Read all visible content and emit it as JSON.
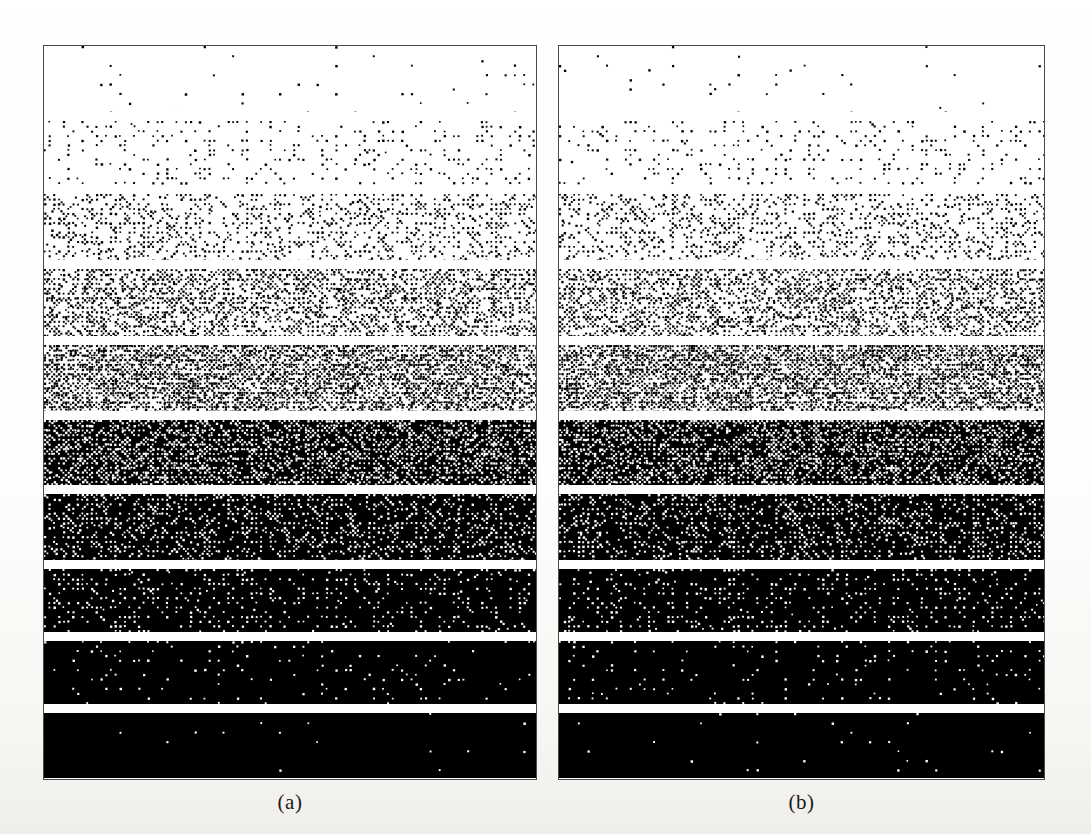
{
  "figure": {
    "type": "halftone-gradient-wedge-pair",
    "background_color": "#ffffff",
    "ink_color": "#000000",
    "border_color": "#4a4a4a",
    "panel_count": 2,
    "band_count_per_panel": 10
  },
  "captions": {
    "panel_a": "(a)",
    "panel_b": "(b)"
  },
  "panels": [
    {
      "id": "panel-a",
      "caption": "(a)",
      "x": 43,
      "y": 45,
      "width": 494,
      "height": 735,
      "bands": [
        {
          "index": 1,
          "gray_level": 0.06,
          "dot_size": 2.0,
          "label": "5%"
        },
        {
          "index": 2,
          "gray_level": 0.16,
          "dot_size": 2.0,
          "label": "15%"
        },
        {
          "index": 3,
          "gray_level": 0.29,
          "dot_size": 2.0,
          "label": "28%"
        },
        {
          "index": 4,
          "gray_level": 0.4,
          "dot_size": 2.0,
          "label": "40%"
        },
        {
          "index": 5,
          "gray_level": 0.5,
          "dot_size": 2.0,
          "label": "50%"
        },
        {
          "index": 6,
          "gray_level": 0.6,
          "dot_size": 2.0,
          "label": "60%"
        },
        {
          "index": 7,
          "gray_level": 0.7,
          "dot_size": 2.0,
          "label": "70%"
        },
        {
          "index": 8,
          "gray_level": 0.8,
          "dot_size": 2.0,
          "label": "80%"
        },
        {
          "index": 9,
          "gray_level": 0.89,
          "dot_size": 2.0,
          "label": "89%"
        },
        {
          "index": 10,
          "gray_level": 0.96,
          "dot_size": 2.0,
          "label": "96%"
        }
      ],
      "band_heights": [
        73,
        71,
        73,
        74,
        73,
        72,
        73,
        70,
        70,
        72
      ],
      "gap_height": 10
    },
    {
      "id": "panel-b",
      "caption": "(b)",
      "x": 558,
      "y": 45,
      "width": 487,
      "height": 735,
      "bands": [
        {
          "index": 1,
          "gray_level": 0.06,
          "dot_size": 2.0,
          "label": "5%"
        },
        {
          "index": 2,
          "gray_level": 0.16,
          "dot_size": 2.0,
          "label": "15%"
        },
        {
          "index": 3,
          "gray_level": 0.29,
          "dot_size": 2.0,
          "label": "28%"
        },
        {
          "index": 4,
          "gray_level": 0.4,
          "dot_size": 2.0,
          "label": "40%"
        },
        {
          "index": 5,
          "gray_level": 0.5,
          "dot_size": 2.0,
          "label": "50%"
        },
        {
          "index": 6,
          "gray_level": 0.6,
          "dot_size": 2.0,
          "label": "60%"
        },
        {
          "index": 7,
          "gray_level": 0.7,
          "dot_size": 2.0,
          "label": "70%"
        },
        {
          "index": 8,
          "gray_level": 0.8,
          "dot_size": 2.0,
          "label": "80%"
        },
        {
          "index": 9,
          "gray_level": 0.89,
          "dot_size": 2.0,
          "label": "89%"
        },
        {
          "index": 10,
          "gray_level": 0.96,
          "dot_size": 2.0,
          "label": "96%"
        }
      ],
      "band_heights": [
        73,
        71,
        73,
        74,
        73,
        72,
        73,
        70,
        70,
        72
      ],
      "gap_height": 10
    }
  ],
  "chart_data": {
    "type": "heatmap",
    "title": "",
    "xlabel": "",
    "ylabel": "",
    "legend_position": "none",
    "grid": false,
    "series": [
      {
        "name": "(a)",
        "categories": [
          "band 1",
          "band 2",
          "band 3",
          "band 4",
          "band 5",
          "band 6",
          "band 7",
          "band 8",
          "band 9",
          "band 10"
        ],
        "values": [
          0.06,
          0.16,
          0.29,
          0.4,
          0.5,
          0.6,
          0.7,
          0.8,
          0.89,
          0.96
        ]
      },
      {
        "name": "(b)",
        "categories": [
          "band 1",
          "band 2",
          "band 3",
          "band 4",
          "band 5",
          "band 6",
          "band 7",
          "band 8",
          "band 9",
          "band 10"
        ],
        "values": [
          0.06,
          0.16,
          0.29,
          0.4,
          0.5,
          0.6,
          0.7,
          0.8,
          0.89,
          0.96
        ]
      }
    ],
    "ylim": [
      0,
      1
    ]
  },
  "caption_positions": {
    "panel_a": {
      "x": 43,
      "y": 790,
      "width": 494
    },
    "panel_b": {
      "x": 558,
      "y": 790,
      "width": 487
    }
  }
}
